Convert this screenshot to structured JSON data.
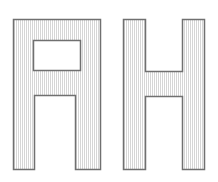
{
  "figure": {
    "title": "",
    "background_color": "#ffffff",
    "width": 218,
    "height": 182,
    "stroke_color": "#707070",
    "stroke_width": 1.5,
    "fill_color": "#ffffff",
    "hatch_color": "#d6d6d6",
    "hatch_pattern": "vertical-lines",
    "hatch_spacing": 2,
    "shapes": [
      {
        "id": "letter-a",
        "label": "A",
        "name": "block-letter-a",
        "description": "Block capital letter A with flat top and rectangular counter",
        "outer_path": "M 13.5 169.5 L 13.5 19.5 L 100.5 19.5 L 100.5 169.5 L 75.5 169.5 L 75.5 95.5 L 34.5 95.5 L 34.5 169.5 Z",
        "hole_path": "M 33.5 40.5 L 80.5 40.5 L 80.5 70.5 L 33.5 70.5 Z",
        "bbox": [
          13,
          19,
          101,
          169
        ]
      },
      {
        "id": "letter-h",
        "label": "H",
        "name": "block-letter-h",
        "description": "Block capital letter H with central crossbar",
        "outer_path": "M 123.5 169.5 L 123.5 19.5 L 145.5 19.5 L 145.5 71.5 L 182.5 71.5 L 182.5 19.5 L 204.5 19.5 L 204.5 169.5 L 182.5 169.5 L 182.5 96.5 L 145.5 96.5 L 145.5 169.5 Z",
        "hole_path": "",
        "bbox": [
          123,
          19,
          204,
          169
        ]
      }
    ]
  },
  "chart_data": {
    "type": "diagram",
    "title": "",
    "items": [
      {
        "label": "A",
        "shape": "polygon-with-hole",
        "x": 13,
        "y": 19,
        "width": 88,
        "height": 150
      },
      {
        "label": "H",
        "shape": "polygon",
        "x": 123,
        "y": 19,
        "width": 81,
        "height": 150
      }
    ]
  }
}
